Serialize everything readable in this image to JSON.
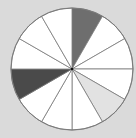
{
  "diagram": {
    "type": "fraction-circle",
    "total_sectors": 12,
    "background": "#dadada",
    "circle_fill": "#ffffff",
    "line_color": "#7a7a7a",
    "center": [
      72,
      69
    ],
    "radius": 61,
    "sectors": [
      {
        "index": 0,
        "fill": "#6e6e6e"
      },
      {
        "index": 1,
        "fill": "#ffffff"
      },
      {
        "index": 2,
        "fill": "#ffffff"
      },
      {
        "index": 3,
        "fill": "#ffffff"
      },
      {
        "index": 4,
        "fill": "#e2e2e2"
      },
      {
        "index": 5,
        "fill": "#ffffff"
      },
      {
        "index": 6,
        "fill": "#ffffff"
      },
      {
        "index": 7,
        "fill": "#ffffff"
      },
      {
        "index": 8,
        "fill": "#4a4a4a"
      },
      {
        "index": 9,
        "fill": "#ffffff"
      },
      {
        "index": 10,
        "fill": "#ffffff"
      },
      {
        "index": 11,
        "fill": "#ffffff"
      }
    ]
  }
}
